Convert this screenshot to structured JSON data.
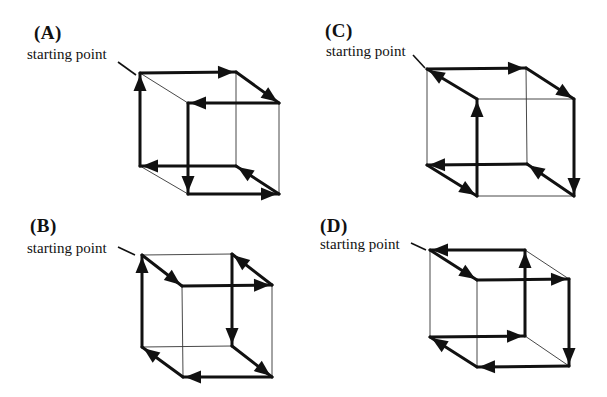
{
  "figure": {
    "panels": [
      {
        "id": "A",
        "label": "(A)",
        "start_label": "starting point",
        "label_pos": [
          34,
          22
        ],
        "start_label_pos": [
          27,
          46
        ],
        "pointer": [
          [
            118,
            62
          ],
          [
            136,
            75
          ]
        ],
        "vertices": {
          "BTL": [
            140,
            73
          ],
          "BTR": [
            236,
            72
          ],
          "FTL": [
            188,
            103
          ],
          "FTR": [
            279,
            103
          ],
          "BBL": [
            140,
            166
          ],
          "BBR": [
            236,
            166
          ],
          "FBL": [
            188,
            194
          ],
          "FBR": [
            279,
            194
          ]
        },
        "path": [
          "BTL",
          "BTR",
          "FTR",
          "FTL",
          "FBL",
          "FBR",
          "BBR",
          "BBL",
          "BTL"
        ]
      },
      {
        "id": "B",
        "label": "(B)",
        "start_label": "starting point",
        "label_pos": [
          30,
          215
        ],
        "start_label_pos": [
          27,
          240
        ],
        "pointer": [
          [
            118,
            247
          ],
          [
            135,
            255
          ]
        ],
        "vertices": {
          "BTL": [
            142,
            255
          ],
          "BTR": [
            232,
            254
          ],
          "FTL": [
            182,
            286
          ],
          "FTR": [
            272,
            285
          ],
          "BBL": [
            142,
            347
          ],
          "BBR": [
            232,
            346
          ],
          "FBL": [
            183,
            377
          ],
          "FBR": [
            272,
            377
          ]
        },
        "path": [
          "BTL",
          "FTL",
          "FTR",
          "BTR",
          "BBR",
          "FBR",
          "FBL",
          "BBL",
          "BTL"
        ]
      },
      {
        "id": "C",
        "label": "(C)",
        "start_label": "starting point",
        "label_pos": [
          325,
          20
        ],
        "start_label_pos": [
          326,
          43
        ],
        "pointer": [
          [
            413,
            55
          ],
          [
            425,
            68
          ]
        ],
        "vertices": {
          "BTL": [
            427,
            69
          ],
          "BTR": [
            526,
            68
          ],
          "FTL": [
            477,
            99
          ],
          "FTR": [
            574,
            99
          ],
          "BBL": [
            427,
            165
          ],
          "BBR": [
            527,
            164
          ],
          "FBL": [
            477,
            196
          ],
          "FBR": [
            574,
            196
          ]
        },
        "path": [
          "BTL",
          "BTR",
          "FTR",
          "FBR",
          "BBR",
          "BBL",
          "FBL",
          "FTL",
          "BTL"
        ]
      },
      {
        "id": "D",
        "label": "(D)",
        "start_label": "starting point",
        "label_pos": [
          320,
          215
        ],
        "start_label_pos": [
          320,
          236
        ],
        "pointer": [
          [
            411,
            243
          ],
          [
            426,
            250
          ]
        ],
        "vertices": {
          "BTL": [
            430,
            250
          ],
          "BTR": [
            525,
            250
          ],
          "FTL": [
            477,
            280
          ],
          "FTR": [
            569,
            279
          ],
          "BBL": [
            430,
            337
          ],
          "BBR": [
            525,
            336
          ],
          "FBL": [
            477,
            367
          ],
          "FBR": [
            569,
            366
          ]
        },
        "path": [
          "BTL",
          "FTL",
          "FTR",
          "FBR",
          "FBL",
          "BBL",
          "BBR",
          "BTR",
          "BTL"
        ]
      }
    ],
    "colors": {
      "stroke": "#111111",
      "thin_edge": "#333333",
      "background": "#ffffff"
    }
  }
}
